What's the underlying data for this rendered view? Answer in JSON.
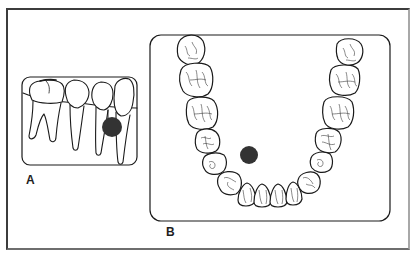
{
  "figure": {
    "panels": [
      {
        "id": "A",
        "label": "A",
        "view": "lateral view of lower posterior teeth with marked spot below tooth"
      },
      {
        "id": "B",
        "label": "B",
        "view": "occlusal view of mandibular arch with marked spot lingual to teeth"
      }
    ],
    "colors": {
      "outline": "#1a1a1a",
      "marker": "#333333",
      "frame_dark": "#3c3c3c",
      "frame_light": "#a8a8a8",
      "background": "#ffffff"
    }
  }
}
